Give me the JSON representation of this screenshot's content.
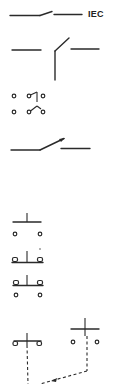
{
  "diagram": {
    "title_label": "IEC",
    "symbols": [
      {
        "id": "switch-no-simple",
        "description": "Normally open switch contact (IEC)"
      },
      {
        "id": "switch-with-vertical-lead",
        "description": "Switch with pivot and vertical connection"
      },
      {
        "id": "contact-grid-two-way",
        "description": "Two-way contact arrangement with terminals"
      },
      {
        "id": "switch-with-arrow",
        "description": "Switch with arrowhead blade"
      },
      {
        "id": "pushbutton-no",
        "description": "Push button, normally open, with terminals"
      },
      {
        "id": "pushbutton-variant-a",
        "description": "Push button variant with square terminals"
      },
      {
        "id": "pushbutton-variant-b",
        "description": "Push button variant with square terminals"
      },
      {
        "id": "linked-pushbuttons",
        "description": "Two mechanically linked push buttons (dashed linkage)"
      }
    ],
    "colors": {
      "line": "#2a2a2a",
      "background": "#ffffff"
    }
  }
}
